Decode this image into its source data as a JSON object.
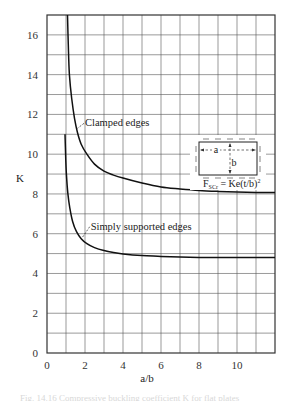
{
  "chart_data": {
    "type": "line",
    "title": "",
    "xlabel": "a/b",
    "ylabel": "K",
    "xlim": [
      0,
      12
    ],
    "ylim": [
      0,
      17
    ],
    "xticks": [
      0,
      2,
      4,
      6,
      8,
      10
    ],
    "xtick_labels": [
      "0",
      "2",
      "4",
      "6",
      "8",
      "10"
    ],
    "yticks": [
      0,
      2,
      4,
      6,
      8,
      10,
      12,
      14,
      16
    ],
    "ytick_labels": [
      "0",
      "2",
      "4",
      "6",
      "8",
      "10",
      "12",
      "14",
      "16"
    ],
    "grid": true,
    "grid_step": {
      "x": 1,
      "y": 1
    },
    "legend": "none",
    "series": [
      {
        "name": "Clamped edges",
        "x": [
          1.08,
          1.12,
          1.18,
          1.3,
          1.45,
          1.6,
          1.8,
          2.1,
          2.5,
          3.0,
          3.5,
          4.0,
          5.0,
          6.0,
          7.0,
          8.0,
          9.0,
          10.0,
          11.0,
          12.0
        ],
        "y": [
          17.0,
          15.5,
          14.0,
          12.8,
          11.8,
          11.1,
          10.5,
          10.0,
          9.5,
          9.15,
          8.95,
          8.8,
          8.55,
          8.35,
          8.25,
          8.18,
          8.13,
          8.1,
          8.08,
          8.07
        ]
      },
      {
        "name": "Simply supported edges",
        "x": [
          0.95,
          0.98,
          1.02,
          1.1,
          1.2,
          1.35,
          1.55,
          1.8,
          2.1,
          2.5,
          3.0,
          3.5,
          4.0,
          5.0,
          6.0,
          7.0,
          8.0,
          9.0,
          10.0,
          11.0,
          12.0
        ],
        "y": [
          11.0,
          10.0,
          9.0,
          8.0,
          7.3,
          6.6,
          6.1,
          5.75,
          5.5,
          5.3,
          5.15,
          5.05,
          4.98,
          4.9,
          4.86,
          4.83,
          4.81,
          4.8,
          4.8,
          4.8,
          4.8
        ]
      }
    ],
    "annotations": [
      {
        "text": "Clamped edges",
        "points_to": [
          1.55,
          11.3
        ],
        "text_at": [
          2.0,
          11.4
        ]
      },
      {
        "text": "Simply supported edges",
        "points_to": [
          1.8,
          5.8
        ],
        "text_at": [
          2.3,
          6.2
        ]
      }
    ],
    "inset": {
      "dimension_a": "a",
      "dimension_b": "b",
      "formula_main": "F",
      "formula_sub": "SCr",
      "formula_rest": " = Ke(t/b)",
      "formula_sup": "2"
    }
  },
  "caption": "Fig. 14.16  Compressive buckling coefficient K for flat plates"
}
